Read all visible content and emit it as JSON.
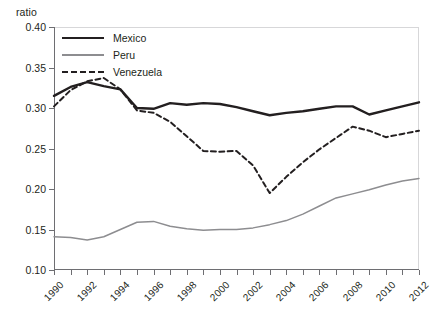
{
  "chart_data": {
    "type": "line",
    "title": "",
    "xlabel": "",
    "ylabel": "ratio",
    "ylim": [
      0.1,
      0.4
    ],
    "xlim": [
      1990,
      2012
    ],
    "ytick_labels": [
      "0.40",
      "0.35",
      "0.30",
      "0.25",
      "0.20",
      "0.15",
      "0.10"
    ],
    "ytick_values": [
      0.4,
      0.35,
      0.3,
      0.25,
      0.2,
      0.15,
      0.1
    ],
    "grid": false,
    "legend_position": "top-left-inside",
    "x": [
      1990,
      1991,
      1992,
      1993,
      1994,
      1995,
      1996,
      1997,
      1998,
      1999,
      2000,
      2001,
      2002,
      2003,
      2004,
      2005,
      2006,
      2007,
      2008,
      2009,
      2010,
      2011,
      2012
    ],
    "xtick_labels": [
      "1990",
      "1992",
      "1994",
      "1996",
      "1998",
      "2000",
      "2002",
      "2004",
      "2006",
      "2008",
      "2010",
      "2012"
    ],
    "xtick_label_years": [
      1990,
      1992,
      1994,
      1996,
      1998,
      2000,
      2002,
      2004,
      2006,
      2008,
      2010,
      2012
    ],
    "series": [
      {
        "name": "Mexico",
        "color": "#231f20",
        "style": "solid",
        "width": 2.4,
        "values": [
          0.315,
          0.326,
          0.332,
          0.327,
          0.323,
          0.3,
          0.299,
          0.306,
          0.304,
          0.306,
          0.305,
          0.301,
          0.296,
          0.291,
          0.294,
          0.296,
          0.299,
          0.302,
          0.302,
          0.292,
          0.297,
          0.302,
          0.307
        ]
      },
      {
        "name": "Peru",
        "color": "#8d8d90",
        "style": "solid",
        "width": 1.5,
        "values": [
          0.141,
          0.14,
          0.137,
          0.141,
          0.15,
          0.159,
          0.16,
          0.154,
          0.151,
          0.149,
          0.15,
          0.15,
          0.152,
          0.156,
          0.161,
          0.169,
          0.179,
          0.189,
          0.194,
          0.199,
          0.205,
          0.21,
          0.213
        ]
      },
      {
        "name": "Venezuela",
        "color": "#231f20",
        "style": "dashed",
        "width": 2.0,
        "values": [
          0.302,
          0.322,
          0.333,
          0.337,
          0.323,
          0.297,
          0.294,
          0.283,
          0.265,
          0.247,
          0.246,
          0.247,
          0.229,
          0.195,
          0.215,
          0.233,
          0.249,
          0.263,
          0.277,
          0.272,
          0.264,
          0.268,
          0.272
        ]
      }
    ]
  },
  "legend": {
    "items": [
      {
        "label": "Mexico"
      },
      {
        "label": "Peru"
      },
      {
        "label": "Venezuela"
      }
    ]
  }
}
